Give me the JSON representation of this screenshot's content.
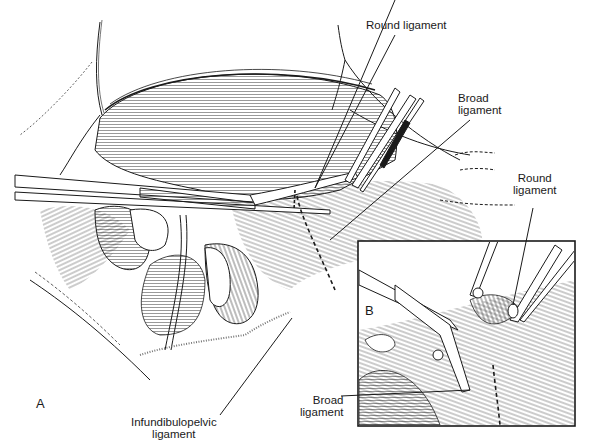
{
  "figure": {
    "panels": [
      {
        "id": "A",
        "letter": "A"
      },
      {
        "id": "B",
        "letter": "B"
      }
    ],
    "labels": {
      "round_ligament_top": "Round ligament",
      "broad_ligament_top_line1": "Broad",
      "broad_ligament_top_line2": "ligament",
      "round_ligament_inset_line1": "Round",
      "round_ligament_inset_line2": "ligament",
      "broad_ligament_inset_line1": "Broad",
      "broad_ligament_inset_line2": "ligament",
      "infundibulopelvic_line1": "Infundibulopelvic",
      "infundibulopelvic_line2": "ligament"
    },
    "colors": {
      "ink": "#1a1a1a",
      "paper": "#ffffff"
    }
  }
}
